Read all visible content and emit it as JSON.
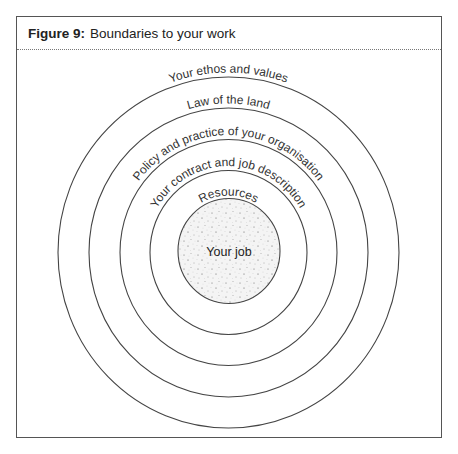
{
  "figure": {
    "number_label": "Figure 9:",
    "title": "Boundaries to your work"
  },
  "diagram": {
    "type": "concentric-circles",
    "rings": [
      {
        "label": "Your ethos and values"
      },
      {
        "label": "Law of the land"
      },
      {
        "label": "Policy and practice of your organisation"
      },
      {
        "label": "Your contract and job description"
      },
      {
        "label": "Resources"
      }
    ],
    "core": {
      "label": "Your job",
      "fill": "stippled"
    },
    "colors": {
      "line": "#444444",
      "text": "#333333",
      "core_fill": "#f2f2f2"
    }
  }
}
